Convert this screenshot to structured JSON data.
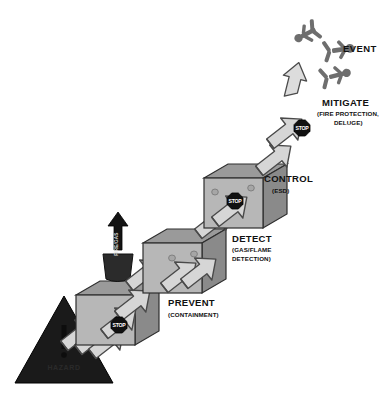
{
  "diagram": {
    "type": "barrier-escalation-diagram",
    "background_color": "#ffffff"
  },
  "hazard": {
    "label": "HAZARD",
    "symbol": "warning-triangle",
    "exclamation": "!",
    "fill_color": "#1a1a1a"
  },
  "event": {
    "label": "EVENT",
    "symbol": "flying-figures",
    "figure_count": 3,
    "fill_color": "#6e6e6e"
  },
  "detector": {
    "label": "FIRE/GAS",
    "symbol": "detector-with-up-arrow",
    "fill_color": "#2b2b2b"
  },
  "stop_sign": {
    "label": "STOP",
    "shape": "octagon",
    "fill_color": "#111111",
    "text_color": "#ffffff"
  },
  "colors": {
    "box_front": "#b7b7b7",
    "box_top": "#9a9a9a",
    "box_side": "#8a8a8a",
    "box_outline": "#2e2e2e",
    "arrow_fill": "#d6d6d6",
    "arrow_outline": "#4a4a4a",
    "hole": "#a6a6a6",
    "text": "#111111"
  },
  "barriers": [
    {
      "id": "prevent",
      "label": "PREVENT",
      "sublabel": "(CONTAINMENT)",
      "order": 1,
      "arrows_in": 3,
      "arrows_out": 2,
      "has_stop_sign": true,
      "holes": 1
    },
    {
      "id": "detect",
      "label": "DETECT",
      "sublabel_line1": "(GAS/FLAME",
      "sublabel_line2": "DETECTION)",
      "order": 2,
      "arrows_in": 2,
      "arrows_out": 2,
      "has_stop_sign": false,
      "holes": 2
    },
    {
      "id": "control",
      "label": "CONTROL",
      "sublabel": "(ESD)",
      "order": 3,
      "arrows_in": 2,
      "arrows_out": 1,
      "has_stop_sign": true,
      "holes": 3
    },
    {
      "id": "mitigate",
      "label": "MITIGATE",
      "sublabel_line1": "(FIRE PROTECTION,",
      "sublabel_line2": "DELUGE)",
      "order": 4,
      "arrows_in": 1,
      "arrows_out": 1,
      "has_stop_sign": true,
      "holes": 3
    }
  ]
}
